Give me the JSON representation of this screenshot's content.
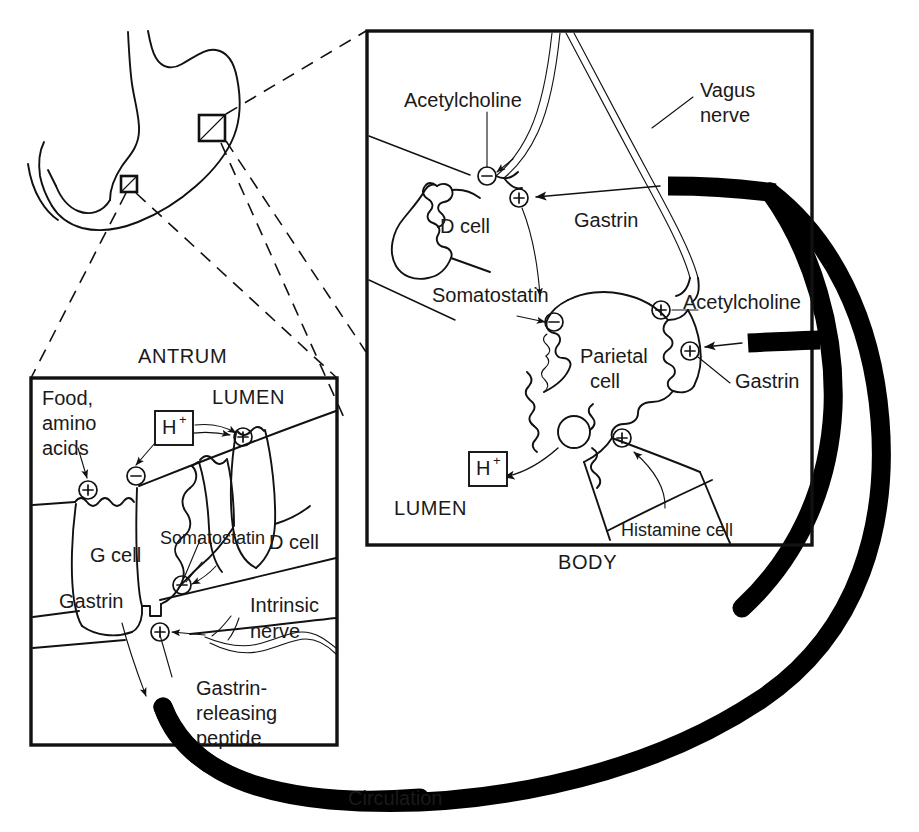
{
  "figure": {
    "background_color": "#ffffff",
    "ink_color": "#111111"
  },
  "overview": {
    "organ_name": "stomach-outline",
    "callout_boxes": [
      {
        "name": "body-callout-marker",
        "label": ""
      },
      {
        "name": "antrum-callout-marker",
        "label": ""
      }
    ]
  },
  "panels": {
    "antrum": {
      "caption": "ANTRUM",
      "lumen_label": "LUMEN",
      "labels": {
        "food": "Food,",
        "food2": "amino",
        "food3": "acids",
        "hydrogen": "H",
        "hydrogen_sup": "+",
        "g_cell": "G cell",
        "d_cell": "D cell",
        "somatostatin": "Somatostatin",
        "gastrin": "Gastrin",
        "intrinsic": "Intrinsic",
        "intrinsic2": "nerve",
        "grp1": "Gastrin-",
        "grp2": "releasing",
        "grp3": "peptide"
      },
      "signs": [
        {
          "name": "plus-food-receptor",
          "glyph": "+"
        },
        {
          "name": "minus-acid-receptor",
          "glyph": "-"
        },
        {
          "name": "plus-acid-lumen",
          "glyph": "+"
        },
        {
          "name": "minus-somatostatin-receptor",
          "glyph": "-"
        },
        {
          "name": "plus-grp-receptor",
          "glyph": "+"
        }
      ]
    },
    "body": {
      "caption": "BODY",
      "lumen_label": "LUMEN",
      "labels": {
        "acetylcholine_top": "Acetylcholine",
        "vagus1": "Vagus",
        "vagus2": "nerve",
        "d_cell": "D cell",
        "gastrin_top": "Gastrin",
        "somatostatin": "Somatostatin",
        "acetylcholine_right": "Acetylcholine",
        "parietal1": "Parietal",
        "parietal2": "cell",
        "gastrin_right": "Gastrin",
        "hydrogen": "H",
        "hydrogen_sup": "+",
        "histamine": "Histamine cell"
      },
      "signs": [
        {
          "name": "minus-ach-d-cell",
          "glyph": "-"
        },
        {
          "name": "plus-gastrin-d-cell",
          "glyph": "+"
        },
        {
          "name": "minus-somatostatin-parietal",
          "glyph": "-"
        },
        {
          "name": "plus-ach-parietal",
          "glyph": "+"
        },
        {
          "name": "plus-gastrin-parietal",
          "glyph": "+"
        },
        {
          "name": "plus-histamine-parietal",
          "glyph": "+"
        }
      ]
    }
  },
  "circulation": {
    "label": "Circulation",
    "color": "#000000"
  }
}
